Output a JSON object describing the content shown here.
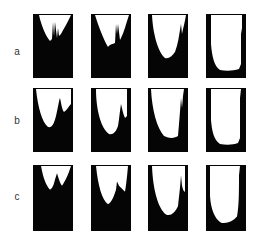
{
  "figure": {
    "rows": [
      {
        "label": "a",
        "panels": [
          {
            "id": "a1",
            "shape": "M1,1 L6,1 C9,14 13,22 17,27 L19,25 L20,8 L21,22 L22,8 L24,24 L25,14 L26,22 L28,20 C31,14 35,8 38,1 Z"
          },
          {
            "id": "a2",
            "shape": "M1,1 L4,1 C8,14 13,26 17,33 C19,30 22,30 24,29 L25,10 L26,20 L27,10 L29,26 L30,24 C33,18 35,10 38,1 Z"
          },
          {
            "id": "a3",
            "shape": "M4,1 C5,20 10,38 17,44 C21,45 24,42 27,38 C30,30 31,22 32,16 L33,10 L34,20 C35,14 37,8 38,1 Z"
          },
          {
            "id": "a4",
            "shape": "M5,1 L5,30 C6,42 8,52 14,56 C20,57 27,57 33,55 L35,50 L35,14 L36,20 L36,1 Z"
          }
        ]
      },
      {
        "label": "b",
        "panels": [
          {
            "id": "b1",
            "shape": "M3,1 C5,20 9,34 15,39 C19,40 21,36 23,28 C25,20 26,12 27,10 C28,14 29,22 31,24 C34,22 36,18 38,16 L38,1 Z"
          },
          {
            "id": "b2",
            "shape": "M5,1 C5,22 10,40 18,46 C22,47 25,44 27,38 C28,32 29,22 30,16 C31,20 32,26 34,30 L36,28 L36,1 Z"
          },
          {
            "id": "b3",
            "shape": "M3,1 C4,22 9,40 16,48 C22,51 27,50 30,48 C31,36 32,24 33,10 L34,20 L35,8 L36,1 Z"
          },
          {
            "id": "b4",
            "shape": "M5,1 L5,32 C6,44 8,52 14,56 C20,57 27,57 32,55 L34,50 L34,10 L35,1 Z"
          }
        ]
      },
      {
        "label": "c",
        "panels": [
          {
            "id": "c1",
            "shape": "M8,1 C10,12 13,20 17,24 C20,22 21,18 22,14 L24,8 C26,14 27,18 29,20 C32,16 35,10 38,1 Z"
          },
          {
            "id": "c2",
            "shape": "M5,1 C7,20 11,34 17,38 C21,36 23,30 25,24 L26,16 L28,20 C30,22 32,24 34,26 C35,20 36,12 37,1 Z"
          },
          {
            "id": "c3",
            "shape": "M4,1 C5,24 10,42 18,48 C23,50 27,46 30,40 C31,30 32,24 33,10 L34,20 C35,24 36,26 37,26 L37,1 Z"
          },
          {
            "id": "c4",
            "shape": "M4,1 L4,30 C5,44 9,52 15,56 C21,57 27,55 31,50 C33,40 33,26 33,10 L34,1 Z"
          }
        ]
      }
    ],
    "colors": {
      "fill": "#050505",
      "cavity": "#ffffff",
      "label": "#333333"
    }
  }
}
